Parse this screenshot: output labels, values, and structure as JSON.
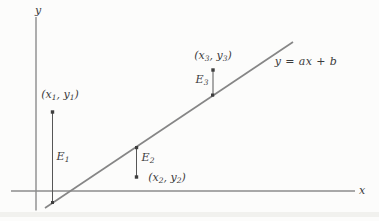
{
  "colors": {
    "background": "#fcfcfb",
    "axis": "#8c8c8c",
    "regression_line": "#868686",
    "error_bar": "#565656",
    "point": "#3e3e3e",
    "text": "#3b3b3b",
    "scan_band": "#e7e7e3"
  },
  "axes": {
    "x_label": "x",
    "y_label": "y"
  },
  "regression_line": {
    "label": "y = ax + b"
  },
  "points": [
    {
      "coord_label": {
        "open": "(x",
        "x_sub": "1",
        "mid": ", y",
        "y_sub": "1",
        "close": ")"
      },
      "error_label": {
        "base": "E",
        "sub": "1"
      }
    },
    {
      "coord_label": {
        "open": "(x",
        "x_sub": "2",
        "mid": ", y",
        "y_sub": "2",
        "close": ")"
      },
      "error_label": {
        "base": "E",
        "sub": "2"
      }
    },
    {
      "coord_label": {
        "open": "(x",
        "x_sub": "3",
        "mid": ", y",
        "y_sub": "3",
        "close": ")"
      },
      "error_label": {
        "base": "E",
        "sub": "3"
      }
    }
  ]
}
